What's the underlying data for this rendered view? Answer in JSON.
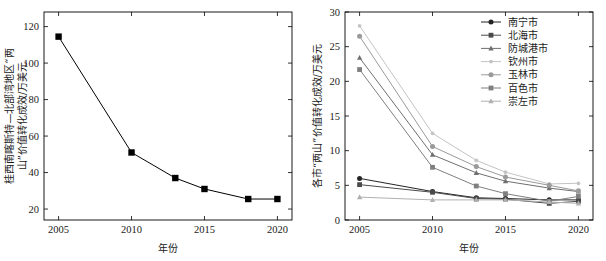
{
  "figure": {
    "background": "#ffffff",
    "width": 606,
    "height": 261,
    "panel_count": 2
  },
  "chart_data": [
    {
      "id": "left-panel",
      "type": "line",
      "title": "",
      "xlabel": "年份",
      "ylabel": "桂西南喀斯特—北部湾地区“两山”价值转化成效/万美元",
      "x": [
        2005,
        2010,
        2013,
        2015,
        2018,
        2020
      ],
      "xlim": [
        2004,
        2021
      ],
      "xticks": [
        2005,
        2010,
        2015,
        2020
      ],
      "xticklabels": [
        "2005",
        "2010",
        "2015",
        "2020"
      ],
      "ylim": [
        14,
        128
      ],
      "yticks": [
        20,
        40,
        60,
        80,
        100,
        120
      ],
      "yticklabels": [
        "20",
        "40",
        "60",
        "80",
        "100",
        "120"
      ],
      "grid": false,
      "legend": "none",
      "series": [
        {
          "name": "桂西南喀斯特—北部湾地区",
          "color": "#000000",
          "marker": "square",
          "values": [
            114.5,
            51.0,
            37.0,
            31.0,
            25.5,
            25.5
          ]
        }
      ]
    },
    {
      "id": "right-panel",
      "type": "line",
      "title": "",
      "xlabel": "年份",
      "ylabel": "各市“两山”价值转化成效/万美元",
      "x": [
        2005,
        2010,
        2013,
        2015,
        2018,
        2020
      ],
      "xlim": [
        2004,
        2021
      ],
      "xticks": [
        2005,
        2010,
        2015,
        2020
      ],
      "xticklabels": [
        "2005",
        "2010",
        "2015",
        "2020"
      ],
      "ylim": [
        0,
        30
      ],
      "yticks": [
        0,
        5,
        10,
        15,
        20,
        25,
        30
      ],
      "yticklabels": [
        "0",
        "5",
        "10",
        "15",
        "20",
        "25",
        "30"
      ],
      "grid": false,
      "legend": "upper right",
      "series": [
        {
          "name": "南宁市",
          "color": "#242424",
          "marker": "circle",
          "values": [
            6.0,
            4.1,
            3.2,
            3.1,
            2.9,
            2.9
          ]
        },
        {
          "name": "北海市",
          "color": "#4a4a4a",
          "marker": "square",
          "values": [
            5.1,
            4.0,
            3.1,
            3.0,
            2.4,
            2.7
          ]
        },
        {
          "name": "防城港市",
          "color": "#6f6f6f",
          "marker": "triangle",
          "values": [
            23.4,
            9.4,
            6.8,
            5.6,
            4.6,
            4.1
          ]
        },
        {
          "name": "钦州市",
          "color": "#c4c4c4",
          "marker": "dot",
          "values": [
            28.0,
            12.5,
            8.6,
            6.9,
            5.2,
            5.3
          ]
        },
        {
          "name": "玉林市",
          "color": "#9a9a9a",
          "marker": "circle",
          "values": [
            26.5,
            10.6,
            7.7,
            6.2,
            5.0,
            4.2
          ]
        },
        {
          "name": "百色市",
          "color": "#7f7f7f",
          "marker": "square",
          "values": [
            21.7,
            7.6,
            4.9,
            3.8,
            2.7,
            3.4
          ]
        },
        {
          "name": "崇左市",
          "color": "#b0b0b0",
          "marker": "triangle",
          "values": [
            3.3,
            2.9,
            2.9,
            2.9,
            2.6,
            2.4
          ]
        }
      ]
    }
  ]
}
